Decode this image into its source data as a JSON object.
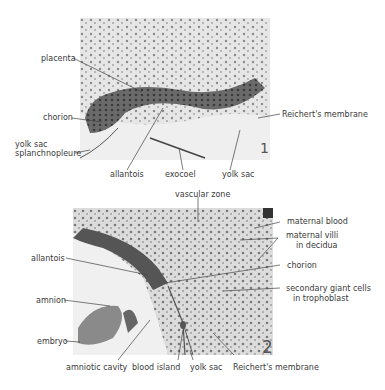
{
  "figure1": {
    "panel_number": "1",
    "labels": {
      "placenta": "placenta",
      "chorion": "chorion",
      "yolk_sac_splanch_1": "yolk sac",
      "yolk_sac_splanch_2": "splanchnopleure",
      "allantois": "allantois",
      "exocoel": "exocoel",
      "yolk_sac": "yolk sac",
      "reicherts_membrane": "Reichert's membrane"
    }
  },
  "figure2": {
    "panel_number": "2",
    "labels": {
      "vascular_zone": "vascular zone",
      "maternal_blood": "maternal blood",
      "maternal_villi_1": "maternal villi",
      "maternal_villi_2": "in decidua",
      "allantois": "allantois",
      "chorion": "chorion",
      "amnion": "amnion",
      "secondary_giant_1": "secondary giant cells",
      "secondary_giant_2": "in trophoblast",
      "embryo": "embryo",
      "amniotic_cavity": "amniotic cavity",
      "blood_island": "blood island",
      "yolk_sac": "yolk sac",
      "reicherts_membrane": "Reichert's membrane"
    }
  }
}
